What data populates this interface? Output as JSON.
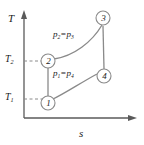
{
  "figure": {
    "type": "temperature-entropy-diagram",
    "axes": {
      "y_label": "T",
      "x_label": "s",
      "y_ticks": [
        {
          "label": "T",
          "sub": "2"
        },
        {
          "label": "T",
          "sub": "1"
        }
      ]
    },
    "states": [
      {
        "id": "1",
        "label": "1"
      },
      {
        "id": "2",
        "label": "2"
      },
      {
        "id": "3",
        "label": "3"
      },
      {
        "id": "4",
        "label": "4"
      }
    ],
    "curve_labels": [
      {
        "id": "upper",
        "text": "p₂ = p₃",
        "p_a": "p",
        "sub_a": "2",
        "eq": "=",
        "p_b": "p",
        "sub_b": "3"
      },
      {
        "id": "lower",
        "text": "p₁ = p₄",
        "p_a": "p",
        "sub_a": "1",
        "eq": "=",
        "p_b": "p",
        "sub_b": "4"
      }
    ],
    "colors": {
      "axis": "#5a5a5a",
      "curve": "#8a8a8a",
      "dashed": "#8a8a8a",
      "text": "#1a1a1a",
      "background": "#ffffff"
    }
  }
}
